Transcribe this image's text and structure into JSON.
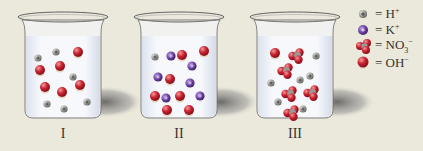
{
  "background": "#ebe8dc",
  "colors": {
    "h_plus": "#9b9a96",
    "k_plus": "#6a3fa0",
    "oxygen": "#c8202e",
    "nitrogen": "#9c9a95",
    "hydrogen_cap": "#e8d6c4",
    "solution": "#f4f6fb"
  },
  "beakers": [
    {
      "label": "I",
      "cx": 63,
      "h_plus": [
        [
          38,
          58
        ],
        [
          56,
          52
        ],
        [
          73,
          77
        ],
        [
          47,
          104
        ],
        [
          64,
          109
        ],
        [
          87,
          102
        ]
      ],
      "k_plus": [],
      "no3_minus": [],
      "oh_minus": [
        [
          78,
          52
        ],
        [
          40,
          70
        ],
        [
          60,
          66
        ],
        [
          45,
          87
        ],
        [
          62,
          92
        ],
        [
          80,
          85
        ]
      ]
    },
    {
      "label": "II",
      "cx": 179,
      "h_plus": [
        [
          155,
          57
        ]
      ],
      "k_plus": [
        [
          171,
          56
        ],
        [
          192,
          66
        ],
        [
          158,
          77
        ],
        [
          190,
          83
        ],
        [
          166,
          98
        ],
        [
          200,
          96
        ]
      ],
      "no3_minus": [],
      "oh_minus": [
        [
          182,
          55
        ],
        [
          204,
          51
        ],
        [
          170,
          79
        ],
        [
          155,
          96
        ],
        [
          180,
          96
        ],
        [
          167,
          110
        ],
        [
          189,
          110
        ]
      ]
    },
    {
      "label": "III",
      "cx": 295,
      "h_plus": [
        [
          316,
          56
        ],
        [
          271,
          83
        ],
        [
          300,
          80
        ],
        [
          310,
          76
        ],
        [
          278,
          102
        ],
        [
          303,
          109
        ]
      ],
      "k_plus": [],
      "no3_minus": [
        [
          297,
          56
        ],
        [
          286,
          71
        ],
        [
          290,
          94
        ],
        [
          312,
          93
        ],
        [
          292,
          113
        ]
      ],
      "oh_minus": [
        [
          275,
          53
        ]
      ]
    }
  ],
  "legend": [
    {
      "icon": "h-plus-icon",
      "label": "= H",
      "charge": "+",
      "sub": ""
    },
    {
      "icon": "k-plus-icon",
      "label": "= K",
      "charge": "+",
      "sub": ""
    },
    {
      "icon": "nitrate-icon",
      "label": "= NO",
      "sub": "3",
      "charge": "−"
    },
    {
      "icon": "hydroxide-icon",
      "label": "= OH",
      "charge": "−",
      "sub": ""
    }
  ]
}
